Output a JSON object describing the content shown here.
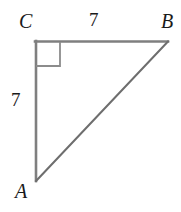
{
  "figure": {
    "kind": "right-triangle-geometry-diagram",
    "background_color": "#ffffff",
    "stroke_color": "#7f7f7f",
    "hypotenuse_color": "#6e6e6e",
    "right_angle_color": "#8c8c8c",
    "text_color": "#1a1a1a",
    "vertices": {
      "A": {
        "label": "A",
        "x": 36,
        "y": 181
      },
      "B": {
        "label": "B",
        "x": 168,
        "y": 41
      },
      "C": {
        "label": "C",
        "x": 35,
        "y": 41
      }
    },
    "sides": [
      {
        "name": "CB",
        "label": "7",
        "position": "top"
      },
      {
        "name": "CA",
        "label": "7",
        "position": "left"
      },
      {
        "name": "AB",
        "label": "",
        "position": "hypotenuse"
      }
    ],
    "right_angle": {
      "at_vertex": "C",
      "marker": "square",
      "size": 25
    }
  }
}
